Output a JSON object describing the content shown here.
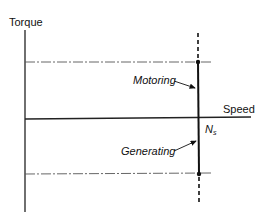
{
  "diagram": {
    "y_axis_label": "Torque",
    "x_axis_label": "Speed",
    "sync_speed_label": "N",
    "sync_speed_subscript": "s",
    "motoring_label": "Motoring",
    "generating_label": "Generating",
    "colors": {
      "line": "#111111",
      "dash_dot": "#555555",
      "background": "#ffffff"
    }
  }
}
